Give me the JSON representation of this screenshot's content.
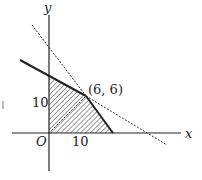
{
  "diagram": {
    "type": "linear-programming-feasible-region",
    "axes": {
      "x_label": "x",
      "y_label": "y",
      "origin_label": "O"
    },
    "tick_labels": {
      "x": "10",
      "y": "10"
    },
    "point": {
      "label": "(6, 6)",
      "x": 6,
      "y": 6
    },
    "colors": {
      "ink": "#222222",
      "background": "#ffffff"
    }
  }
}
